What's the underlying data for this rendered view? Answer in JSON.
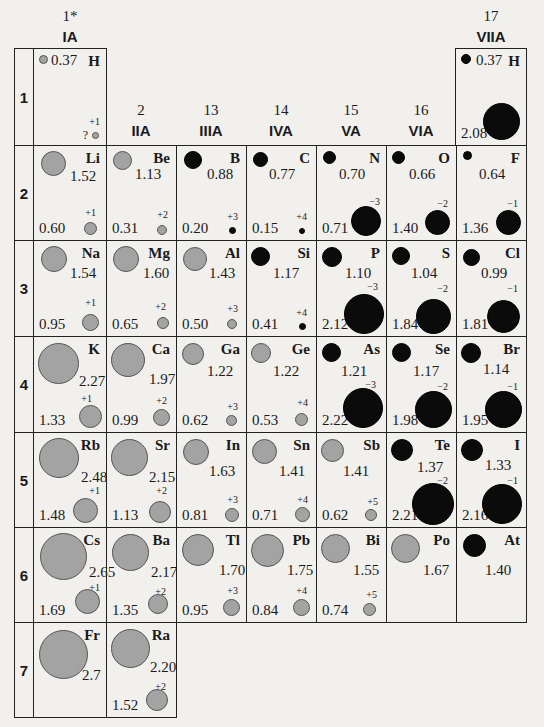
{
  "groups": [
    {
      "num": "1*",
      "label": "IA"
    },
    {
      "num": "2",
      "label": "IIA"
    },
    {
      "num": "13",
      "label": "IIIA"
    },
    {
      "num": "14",
      "label": "IVA"
    },
    {
      "num": "15",
      "label": "VA"
    },
    {
      "num": "16",
      "label": "VIA"
    },
    {
      "num": "17",
      "label": "VIIA"
    }
  ],
  "periods": [
    "1",
    "2",
    "3",
    "4",
    "5",
    "6",
    "7"
  ],
  "legend": {
    "metal_color": "#a3a3a3",
    "nonmetal_color": "#0b0b0b",
    "atom_unit": "Å"
  },
  "elements": {
    "H1": {
      "symbol": "H",
      "atomic_radius": "0.37",
      "ionic_radius": "?",
      "charge": "+1",
      "type": "metal"
    },
    "H17": {
      "symbol": "H",
      "atomic_radius": "0.37",
      "ionic_radius": "2.08",
      "charge": "",
      "type": "nonmetal"
    },
    "Li": {
      "symbol": "Li",
      "atomic_radius": "1.52",
      "ionic_radius": "0.60",
      "charge": "+1",
      "type": "metal"
    },
    "Be": {
      "symbol": "Be",
      "atomic_radius": "1.13",
      "ionic_radius": "0.31",
      "charge": "+2",
      "type": "metal"
    },
    "B": {
      "symbol": "B",
      "atomic_radius": "0.88",
      "ionic_radius": "0.20",
      "charge": "+3",
      "type": "nonmetal"
    },
    "C": {
      "symbol": "C",
      "atomic_radius": "0.77",
      "ionic_radius": "0.15",
      "charge": "+4",
      "type": "nonmetal"
    },
    "N": {
      "symbol": "N",
      "atomic_radius": "0.70",
      "ionic_radius": "0.71",
      "charge": "−3",
      "type": "nonmetal"
    },
    "O": {
      "symbol": "O",
      "atomic_radius": "0.66",
      "ionic_radius": "1.40",
      "charge": "−2",
      "type": "nonmetal"
    },
    "F": {
      "symbol": "F",
      "atomic_radius": "0.64",
      "ionic_radius": "1.36",
      "charge": "−1",
      "type": "nonmetal"
    },
    "Na": {
      "symbol": "Na",
      "atomic_radius": "1.54",
      "ionic_radius": "0.95",
      "charge": "+1",
      "type": "metal"
    },
    "Mg": {
      "symbol": "Mg",
      "atomic_radius": "1.60",
      "ionic_radius": "0.65",
      "charge": "+2",
      "type": "metal"
    },
    "Al": {
      "symbol": "Al",
      "atomic_radius": "1.43",
      "ionic_radius": "0.50",
      "charge": "+3",
      "type": "metal"
    },
    "Si": {
      "symbol": "Si",
      "atomic_radius": "1.17",
      "ionic_radius": "0.41",
      "charge": "+4",
      "type": "nonmetal"
    },
    "P": {
      "symbol": "P",
      "atomic_radius": "1.10",
      "ionic_radius": "2.12",
      "charge": "−3",
      "type": "nonmetal"
    },
    "S": {
      "symbol": "S",
      "atomic_radius": "1.04",
      "ionic_radius": "1.84",
      "charge": "−2",
      "type": "nonmetal"
    },
    "Cl": {
      "symbol": "Cl",
      "atomic_radius": "0.99",
      "ionic_radius": "1.81",
      "charge": "−1",
      "type": "nonmetal"
    },
    "K": {
      "symbol": "K",
      "atomic_radius": "2.27",
      "ionic_radius": "1.33",
      "charge": "+1",
      "type": "metal"
    },
    "Ca": {
      "symbol": "Ca",
      "atomic_radius": "1.97",
      "ionic_radius": "0.99",
      "charge": "+2",
      "type": "metal"
    },
    "Ga": {
      "symbol": "Ga",
      "atomic_radius": "1.22",
      "ionic_radius": "0.62",
      "charge": "+3",
      "type": "metal"
    },
    "Ge": {
      "symbol": "Ge",
      "atomic_radius": "1.22",
      "ionic_radius": "0.53",
      "charge": "+4",
      "type": "metal"
    },
    "As": {
      "symbol": "As",
      "atomic_radius": "1.21",
      "ionic_radius": "2.22",
      "charge": "−3",
      "type": "nonmetal"
    },
    "Se": {
      "symbol": "Se",
      "atomic_radius": "1.17",
      "ionic_radius": "1.98",
      "charge": "−2",
      "type": "nonmetal"
    },
    "Br": {
      "symbol": "Br",
      "atomic_radius": "1.14",
      "ionic_radius": "1.95",
      "charge": "−1",
      "type": "nonmetal"
    },
    "Rb": {
      "symbol": "Rb",
      "atomic_radius": "2.48",
      "ionic_radius": "1.48",
      "charge": "+1",
      "type": "metal"
    },
    "Sr": {
      "symbol": "Sr",
      "atomic_radius": "2.15",
      "ionic_radius": "1.13",
      "charge": "+2",
      "type": "metal"
    },
    "In": {
      "symbol": "In",
      "atomic_radius": "1.63",
      "ionic_radius": "0.81",
      "charge": "+3",
      "type": "metal"
    },
    "Sn": {
      "symbol": "Sn",
      "atomic_radius": "1.41",
      "ionic_radius": "0.71",
      "charge": "+4",
      "type": "metal"
    },
    "Sb": {
      "symbol": "Sb",
      "atomic_radius": "1.41",
      "ionic_radius": "0.62",
      "charge": "+5",
      "type": "metal"
    },
    "Te": {
      "symbol": "Te",
      "atomic_radius": "1.37",
      "ionic_radius": "2.21",
      "charge": "−2",
      "type": "nonmetal"
    },
    "I": {
      "symbol": "I",
      "atomic_radius": "1.33",
      "ionic_radius": "2.16",
      "charge": "−1",
      "type": "nonmetal"
    },
    "Cs": {
      "symbol": "Cs",
      "atomic_radius": "2.65",
      "ionic_radius": "1.69",
      "charge": "+1",
      "type": "metal"
    },
    "Ba": {
      "symbol": "Ba",
      "atomic_radius": "2.17",
      "ionic_radius": "1.35",
      "charge": "+2",
      "type": "metal"
    },
    "Tl": {
      "symbol": "Tl",
      "atomic_radius": "1.70",
      "ionic_radius": "0.95",
      "charge": "+3",
      "type": "metal"
    },
    "Pb": {
      "symbol": "Pb",
      "atomic_radius": "1.75",
      "ionic_radius": "0.84",
      "charge": "+4",
      "type": "metal"
    },
    "Bi": {
      "symbol": "Bi",
      "atomic_radius": "1.55",
      "ionic_radius": "0.74",
      "charge": "+5",
      "type": "metal"
    },
    "Po": {
      "symbol": "Po",
      "atomic_radius": "1.67",
      "ionic_radius": "",
      "charge": "",
      "type": "metal"
    },
    "At": {
      "symbol": "At",
      "atomic_radius": "1.40",
      "ionic_radius": "",
      "charge": "",
      "type": "nonmetal"
    },
    "Fr": {
      "symbol": "Fr",
      "atomic_radius": "2.7",
      "ionic_radius": "",
      "charge": "",
      "type": "metal"
    },
    "Ra": {
      "symbol": "Ra",
      "atomic_radius": "2.20",
      "ionic_radius": "1.52",
      "charge": "+2",
      "type": "metal"
    }
  }
}
